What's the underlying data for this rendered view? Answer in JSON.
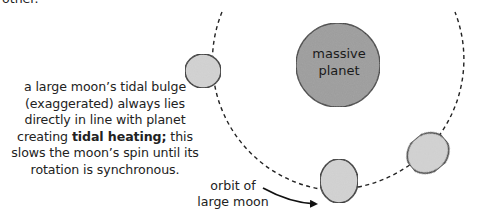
{
  "top_cutoff_text": "other.",
  "planet": {
    "label_line1": "massive",
    "label_line2": "planet",
    "fill": "#9b9b9b",
    "center": [
      338,
      65
    ],
    "radius": 42
  },
  "caption": {
    "line1": "a large moon’s tidal bulge",
    "line2": "(exaggerated) always lies",
    "line3": "directly in line with planet",
    "line4_pre": "creating ",
    "line4_bold": "tidal heating;",
    "line4_post": " this",
    "line5": "slows the moon’s spin until its",
    "line6": "rotation is synchronous."
  },
  "orbit_label": {
    "line1": "orbit of",
    "line2": "large moon"
  },
  "orbit": {
    "center": [
      338,
      60
    ],
    "radius": 130,
    "style": "dashed"
  },
  "moons": [
    {
      "name": "left-moon",
      "center": [
        203,
        71
      ],
      "rx": 18,
      "ry": 17,
      "rotation": 0
    },
    {
      "name": "bottom-moon",
      "center": [
        339,
        181
      ],
      "rx": 19,
      "ry": 22,
      "rotation": 0
    },
    {
      "name": "right-moon",
      "center": [
        428,
        153
      ],
      "rx": 22,
      "ry": 19,
      "rotation": -40
    }
  ],
  "colors": {
    "moon_fill": "#d4d4d4",
    "outline": "#222222",
    "text": "#222222"
  }
}
